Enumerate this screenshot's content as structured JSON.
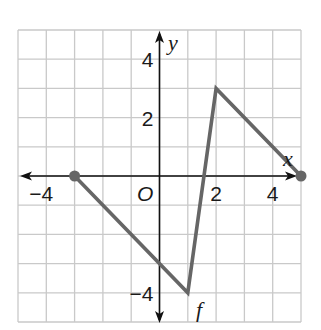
{
  "chart_data": {
    "type": "line",
    "title": "",
    "xlabel": "x",
    "ylabel": "y",
    "origin_label": "O",
    "function_label": "f",
    "xlim": [
      -5,
      5
    ],
    "ylim": [
      -5,
      5
    ],
    "grid": true,
    "x_tick_labels": [
      {
        "value": -4,
        "label": "−4"
      },
      {
        "value": 2,
        "label": "2"
      },
      {
        "value": 4,
        "label": "4"
      }
    ],
    "y_tick_labels": [
      {
        "value": 4,
        "label": "4"
      },
      {
        "value": 2,
        "label": "2"
      },
      {
        "value": -4,
        "label": "−4"
      }
    ],
    "series": [
      {
        "name": "f",
        "x": [
          -3,
          1,
          2,
          5
        ],
        "y": [
          0,
          -4,
          3,
          0
        ],
        "endpoints": "closed",
        "color": "#666666"
      }
    ],
    "colors": {
      "grid": "#c9c9c9",
      "axis": "#111111",
      "line": "#666666"
    }
  }
}
